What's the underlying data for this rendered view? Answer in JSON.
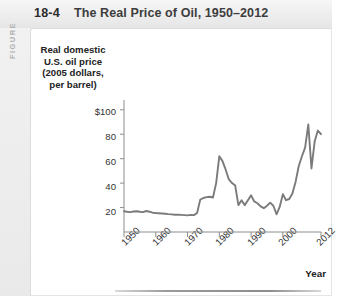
{
  "figure": {
    "kicker": "FIGURE",
    "number": "18-4",
    "title": "The Real Price of Oil, 1950–2012"
  },
  "colors": {
    "line": "#7b7b7b",
    "axis": "#8e8e8e",
    "panel_bg": "#ffffff",
    "chrome_bg": "#ededed",
    "kicker": "#b0b0b0",
    "title_text": "#3d3d3d",
    "rule": "#9a9a9a"
  },
  "chart_data": {
    "type": "line",
    "title": "The Real Price of Oil, 1950–2012",
    "ylabel": "Real domestic U.S. oil price (2005 dollars, per barrel)",
    "ylabel_lines": [
      "Real domestic",
      "U.S. oil price",
      "(2005 dollars,",
      "per barrel)"
    ],
    "xlabel": "Year",
    "grid": false,
    "legend": null,
    "xlim": [
      1950,
      2012
    ],
    "ylim": [
      0,
      108
    ],
    "yticks": [
      20,
      40,
      60,
      80,
      100
    ],
    "ytick_labels": [
      "20",
      "40",
      "60",
      "80",
      "$100"
    ],
    "xticks": [
      1950,
      1960,
      1970,
      1980,
      1990,
      2000,
      2012
    ],
    "xtick_labels": [
      "1950",
      "1960",
      "1970",
      "1980",
      "1990",
      "2000",
      "2012"
    ],
    "series": [
      {
        "name": "Real domestic U.S. oil price",
        "x": [
          1950,
          1951,
          1952,
          1953,
          1954,
          1955,
          1956,
          1957,
          1958,
          1959,
          1960,
          1961,
          1962,
          1963,
          1964,
          1965,
          1966,
          1967,
          1968,
          1969,
          1970,
          1971,
          1972,
          1973,
          1974,
          1975,
          1976,
          1977,
          1978,
          1979,
          1980,
          1981,
          1982,
          1983,
          1984,
          1985,
          1986,
          1987,
          1988,
          1989,
          1990,
          1991,
          1992,
          1993,
          1994,
          1995,
          1996,
          1997,
          1998,
          1999,
          2000,
          2001,
          2002,
          2003,
          2004,
          2005,
          2006,
          2007,
          2008,
          2009,
          2010,
          2011,
          2012
        ],
        "y": [
          17.0,
          16.6,
          16.3,
          16.8,
          17.0,
          16.6,
          16.3,
          17.2,
          16.6,
          15.8,
          15.5,
          15.3,
          15.1,
          14.9,
          14.6,
          14.4,
          14.1,
          14.2,
          14.0,
          13.8,
          13.6,
          14.0,
          13.8,
          15.6,
          26.5,
          27.8,
          28.5,
          28.8,
          28.2,
          40.0,
          62.0,
          58.0,
          51.0,
          43.0,
          40.0,
          38.0,
          22.0,
          26.0,
          22.0,
          26.0,
          30.0,
          25.0,
          23.5,
          21.0,
          19.5,
          21.5,
          24.0,
          21.5,
          14.5,
          20.5,
          31.0,
          26.0,
          27.0,
          31.5,
          41.0,
          54.0,
          62.0,
          69.0,
          88.0,
          52.0,
          74.0,
          83.0,
          80.0
        ]
      }
    ]
  }
}
